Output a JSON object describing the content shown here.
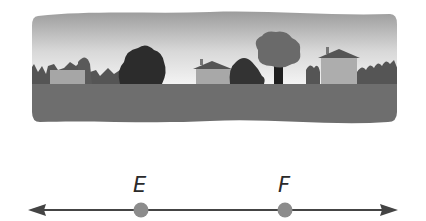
{
  "scene": {
    "description": "Neighborhood street scene",
    "colors": {
      "sky_top": "#9a9a9a",
      "sky_bottom": "#f2f2f2",
      "ground": "#6e6e6e",
      "dark_shrub": "#2e2e2e",
      "mid_shrub": "#5a5a5a",
      "house_wall": "#a8a8a8",
      "house_roof": "#555555",
      "tree_crown": "#6a6a6a",
      "tree_trunk": "#1e1e1e"
    }
  },
  "line": {
    "points": [
      {
        "label": "E",
        "x": 141
      },
      {
        "label": "F",
        "x": 285
      }
    ],
    "colors": {
      "line": "#444444",
      "point": "#8c8c8c"
    }
  }
}
